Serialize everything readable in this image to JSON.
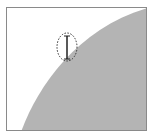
{
  "canvas": {
    "background": "#ffffff",
    "border_color": "#8a8a8a",
    "shape_fill": "#b4b4b4",
    "shape": "arc-region"
  },
  "cursor": {
    "icon": "ellipse-select-resize-cursor",
    "stroke": "#333333"
  }
}
